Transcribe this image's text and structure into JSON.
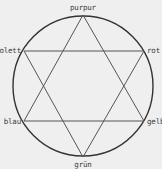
{
  "diagram": {
    "type": "color-hexagram",
    "circle": {
      "cx": 83,
      "cy": 86,
      "r": 70,
      "stroke": "#333333",
      "stroke_width": 1.4
    },
    "line_color": "#555555",
    "background": "#efefef",
    "nodes": [
      {
        "id": "purpur",
        "label": "purpur",
        "x": 83,
        "y": 15,
        "label_x": 83,
        "label_y": 10,
        "anchor": "middle"
      },
      {
        "id": "rot",
        "label": "rot",
        "x": 144,
        "y": 51,
        "label_x": 147,
        "label_y": 53,
        "anchor": "start"
      },
      {
        "id": "gelb",
        "label": "gelb",
        "x": 144,
        "y": 121,
        "label_x": 147,
        "label_y": 124,
        "anchor": "start"
      },
      {
        "id": "gruen",
        "label": "grün",
        "x": 83,
        "y": 157,
        "label_x": 83,
        "label_y": 167,
        "anchor": "middle"
      },
      {
        "id": "blau",
        "label": "blau",
        "x": 24,
        "y": 121,
        "label_x": 21,
        "label_y": 124,
        "anchor": "end"
      },
      {
        "id": "violett",
        "label": "violett",
        "x": 24,
        "y": 51,
        "label_x": 21,
        "label_y": 53,
        "anchor": "end"
      }
    ],
    "triangles": [
      {
        "name": "triangle-up",
        "vertices": [
          "purpur",
          "gelb",
          "blau"
        ]
      },
      {
        "name": "triangle-down",
        "vertices": [
          "violett",
          "rot",
          "gruen"
        ]
      }
    ],
    "labels": {
      "purpur": "purpur",
      "rot": "rot",
      "gelb": "gelb",
      "gruen": "grün",
      "blau": "blau",
      "violett": "violett"
    }
  }
}
